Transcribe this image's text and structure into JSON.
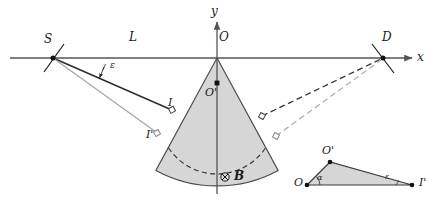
{
  "figure": {
    "background": "#ffffff",
    "width": 441,
    "height": 212
  },
  "colors": {
    "axis": "#555555",
    "ray_primary": "#2b2b2b",
    "ray_secondary": "#a8a8a8",
    "sector_fill": "#d6d6d6",
    "sector_stroke": "#4a4a4a",
    "arc_primary": "#333333",
    "arc_secondary": "#b0b0b0",
    "label": "#1a1a1a",
    "triangle_fill": "#d6d6d6",
    "triangle_stroke": "#3a3a3a"
  },
  "axes": {
    "x_label": "x",
    "y_label": "y",
    "origin_label": "O",
    "x_axis_y": 58,
    "y_axis_x": 217
  },
  "points": [
    {
      "id": "S",
      "label": "S",
      "x": 53,
      "y": 58,
      "marker": "cross-dot",
      "note": "source on x axis"
    },
    {
      "id": "O",
      "label": "O",
      "x": 217,
      "y": 58,
      "marker": "apex",
      "note": "origin, sector apex"
    },
    {
      "id": "D",
      "label": "D",
      "x": 383,
      "y": 58,
      "marker": "cross-dot",
      "note": "detector on x axis"
    },
    {
      "id": "Op",
      "label": "O'",
      "x": 217,
      "y": 83,
      "marker": "dot",
      "note": "center of curvature"
    },
    {
      "id": "I",
      "label": "I",
      "x": 172,
      "y": 110,
      "marker": "open-dot",
      "note": "entry point primary ray"
    },
    {
      "id": "Ip",
      "label": "I'",
      "x": 157,
      "y": 133,
      "marker": "open-dot",
      "note": "entry point secondary ray"
    }
  ],
  "segments": {
    "L_label": "L",
    "L_label_x": 133,
    "L_label_y": 42,
    "epsilon_label": "ε",
    "epsilon_label_x": 100,
    "epsilon_label_y": 70
  },
  "field": {
    "symbol": "⊗",
    "label": "B",
    "x": 225,
    "y": 177,
    "meaning": "magnetic field into page"
  },
  "sector": {
    "apex_x": 217,
    "apex_y": 58,
    "radius": 128,
    "half_angle_deg": 29,
    "fill": "#d6d6d6",
    "arcs": [
      {
        "id": "arc-primary",
        "radius": 58,
        "style": "dashed",
        "color": "#333333"
      },
      {
        "id": "arc-secondary",
        "radius": 78,
        "style": "dashed",
        "color": "#b0b0b0"
      }
    ]
  },
  "rays": [
    {
      "id": "ray-S-I",
      "from": "S",
      "to": "I",
      "style": "solid",
      "color": "#2b2b2b"
    },
    {
      "id": "ray-S-Ip",
      "from": "S",
      "to": "I'",
      "style": "solid",
      "color": "#a8a8a8"
    },
    {
      "id": "ray-exit-D-primary",
      "to": "D",
      "style": "dashed",
      "color": "#333333"
    },
    {
      "id": "ray-exit-D-secondary",
      "to": "D",
      "style": "dashed",
      "color": "#b0b0b0"
    }
  ],
  "inset_triangle": {
    "caption": "detail triangle O O' I'",
    "vertices": [
      {
        "label": "O",
        "x": 307,
        "y": 185
      },
      {
        "label": "O'",
        "x": 330,
        "y": 162
      },
      {
        "label": "I'",
        "x": 412,
        "y": 185
      }
    ],
    "angles": [
      {
        "label": "α",
        "at": "O",
        "x": 316,
        "y": 179
      },
      {
        "label": "ε",
        "at": "I'",
        "x": 385,
        "y": 178
      }
    ]
  }
}
